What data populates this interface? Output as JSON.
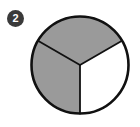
{
  "figure": {
    "type": "fraction-pie-diagram",
    "background_color": "#ffffff",
    "badge": {
      "label": "2",
      "fill_color": "#3a3a3a",
      "text_color": "#ffffff",
      "center_x": 15.5,
      "center_y": 18.5,
      "radius": 8.5
    },
    "pie": {
      "center_x": 80,
      "center_y": 65,
      "radius": 48.5,
      "outline_color": "#111111",
      "outline_width": 2.6,
      "divider_color": "#111111",
      "divider_width": 1.8,
      "shaded_color": "#9a9a9a",
      "unshaded_color": "#ffffff",
      "total_sectors": 3,
      "shaded_sectors": 2,
      "fraction_label": "2/3",
      "sector_angle_degrees": 120,
      "sectors": [
        {
          "name": "top-sector",
          "start_angle_degrees": 210,
          "end_angle_degrees": 330,
          "shaded": true,
          "fill": "#9a9a9a"
        },
        {
          "name": "left-sector",
          "start_angle_degrees": 90,
          "end_angle_degrees": 210,
          "shaded": true,
          "fill": "#9a9a9a"
        },
        {
          "name": "right-sector",
          "start_angle_degrees": 330,
          "end_angle_degrees": 90,
          "shaded": false,
          "fill": "#ffffff"
        }
      ],
      "dividers": [
        {
          "name": "divider-down",
          "angle_degrees": 90,
          "end_x": 80,
          "end_y": 113.5
        },
        {
          "name": "divider-upper-left",
          "angle_degrees": 210,
          "end_x": 38,
          "end_y": 40.75
        },
        {
          "name": "divider-upper-right",
          "angle_degrees": 330,
          "end_x": 122,
          "end_y": 40.75
        }
      ]
    }
  }
}
